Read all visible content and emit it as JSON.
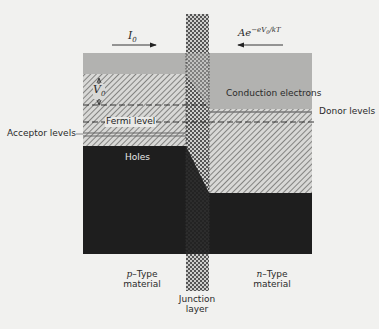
{
  "diagram": {
    "colors": {
      "background": "#f1f1ef",
      "conduction_band": "#b4b4b2",
      "hatch_fill": "#d6d6d4",
      "hatch_line": "#7a7a78",
      "valence_dark": "#1c1c1c",
      "junction_check": "#6a6a6a"
    },
    "labels": {
      "current_left": "I",
      "current_left_sub": "0",
      "current_right_prefix": "Ae",
      "current_right_exp": "−eV",
      "current_right_exp_sub": "0",
      "current_right_exp_tail": "/kT",
      "potential": "V",
      "potential_sub": "0",
      "conduction_electrons": "Conduction electrons",
      "fermi_level": "Fermi level",
      "acceptor_levels": "Acceptor levels",
      "donor_levels": "Donor levels",
      "holes": "Holes",
      "p_type_line1_ital": "p",
      "p_type_line1": "–Type",
      "p_type_line2": "material",
      "n_type_line1_ital": "n",
      "n_type_line1": "–Type",
      "n_type_line2": "material",
      "junction_line1": "Junction",
      "junction_line2": "layer"
    }
  }
}
